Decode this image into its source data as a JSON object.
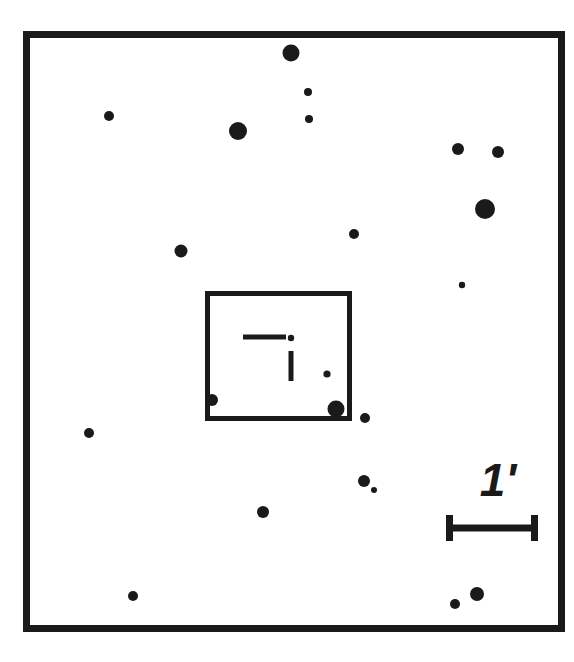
{
  "figure": {
    "kind": "astronomical-finder-chart",
    "width": 574,
    "height": 662,
    "background_color": "#ffffff",
    "ink_color": "#1a1a1a"
  },
  "outer_frame": {
    "label": "field-of-view-border",
    "x": 23,
    "y": 31,
    "width": 542,
    "height": 601,
    "stroke_width": 7,
    "color": "#1a1a1a"
  },
  "inner_box": {
    "label": "slit-or-detector-footprint",
    "x": 205,
    "y": 291,
    "width": 147,
    "height": 130,
    "stroke_width": 5,
    "color": "#1a1a1a"
  },
  "target_marker": {
    "label": "target-crosshair",
    "color": "#1a1a1a",
    "horizontal_tick": {
      "x1": 243,
      "y1": 337,
      "x2": 286,
      "y2": 337,
      "stroke_width": 5
    },
    "vertical_tick": {
      "x1": 291,
      "y1": 351,
      "x2": 291,
      "y2": 381,
      "stroke_width": 5
    },
    "center_dot": {
      "cx": 291,
      "cy": 338,
      "r": 3.2
    }
  },
  "scale_bar": {
    "label": "1'",
    "label_text": "1",
    "prime_text": "′",
    "label_x": 498,
    "label_y": 496,
    "label_font_size": 46,
    "bar": {
      "x1": 446,
      "x2": 538,
      "y": 528,
      "stroke_width": 7,
      "cap_height": 26,
      "cap_stroke_width": 7
    },
    "units": "arcminute",
    "length_value": 1
  },
  "chart_data": {
    "type": "scatter",
    "title": "",
    "xlabel": "",
    "ylabel": "",
    "xlim": [
      23,
      565
    ],
    "ylim": [
      31,
      632
    ],
    "grid": false,
    "legend": null,
    "marker_color": "#1a1a1a",
    "note": "Field stars rendered as filled circles; radius encodes apparent brightness (larger = brighter).",
    "stars": [
      {
        "id": "s01",
        "cx": 291,
        "cy": 53,
        "r": 8.5
      },
      {
        "id": "s02",
        "cx": 109,
        "cy": 116,
        "r": 5.0
      },
      {
        "id": "s03",
        "cx": 308,
        "cy": 92,
        "r": 4.0
      },
      {
        "id": "s04",
        "cx": 309,
        "cy": 119,
        "r": 4.0
      },
      {
        "id": "s05",
        "cx": 238,
        "cy": 131,
        "r": 9.0
      },
      {
        "id": "s06",
        "cx": 458,
        "cy": 149,
        "r": 6.0
      },
      {
        "id": "s07",
        "cx": 498,
        "cy": 152,
        "r": 6.0
      },
      {
        "id": "s08",
        "cx": 485,
        "cy": 209,
        "r": 10.0
      },
      {
        "id": "s09",
        "cx": 354,
        "cy": 234,
        "r": 5.0
      },
      {
        "id": "s10",
        "cx": 181,
        "cy": 251,
        "r": 6.5
      },
      {
        "id": "s11",
        "cx": 462,
        "cy": 285,
        "r": 3.2
      },
      {
        "id": "s12",
        "cx": 327,
        "cy": 374,
        "r": 3.6
      },
      {
        "id": "s13",
        "cx": 212,
        "cy": 400,
        "r": 6.0
      },
      {
        "id": "s14",
        "cx": 336,
        "cy": 409,
        "r": 8.5
      },
      {
        "id": "s15",
        "cx": 365,
        "cy": 418,
        "r": 5.0
      },
      {
        "id": "s16",
        "cx": 89,
        "cy": 433,
        "r": 5.0
      },
      {
        "id": "s17",
        "cx": 364,
        "cy": 481,
        "r": 6.0
      },
      {
        "id": "s18",
        "cx": 374,
        "cy": 490,
        "r": 3.0
      },
      {
        "id": "s19",
        "cx": 263,
        "cy": 512,
        "r": 6.0
      },
      {
        "id": "s20",
        "cx": 133,
        "cy": 596,
        "r": 5.0
      },
      {
        "id": "s21",
        "cx": 477,
        "cy": 594,
        "r": 7.0
      },
      {
        "id": "s22",
        "cx": 455,
        "cy": 604,
        "r": 5.0
      }
    ]
  }
}
